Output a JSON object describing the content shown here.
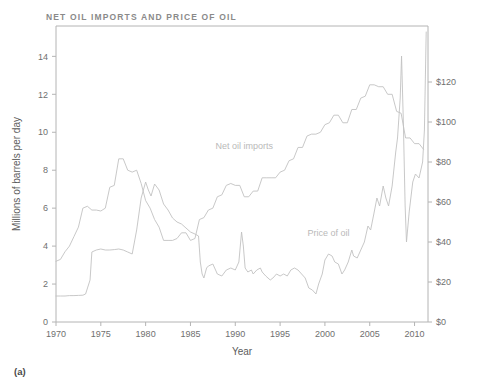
{
  "figure": {
    "title": "NET OIL IMPORTS AND PRICE OF OIL",
    "panel_label": "(a)"
  },
  "chart_data": {
    "type": "line",
    "title": "NET OIL IMPORTS AND PRICE OF OIL",
    "xlabel": "Year",
    "ylabel": "Millions of barrels per day",
    "y2label": "",
    "grid": false,
    "legend": "inline-annotations",
    "xlim": [
      1970,
      2011.5
    ],
    "ylim": [
      0,
      15.6
    ],
    "y2lim": [
      0,
      148
    ],
    "xticks": [
      1970,
      1975,
      1980,
      1985,
      1990,
      1995,
      2000,
      2005,
      2010
    ],
    "xticklabels": [
      "1970",
      "1975",
      "1980",
      "1985",
      "1990",
      "1995",
      "2000",
      "2005",
      "2010"
    ],
    "yticks": [
      0,
      2,
      4,
      6,
      8,
      10,
      12,
      14
    ],
    "yticklabels": [
      "0",
      "2",
      "4",
      "6",
      "8",
      "10",
      "12",
      "14"
    ],
    "y2ticks": [
      0,
      20,
      40,
      60,
      80,
      100,
      120
    ],
    "y2ticklabels": [
      "$0",
      "$20",
      "$40",
      "$60",
      "$80",
      "$100",
      "$120"
    ],
    "line_color": "#c2c2c2",
    "annotations": [
      {
        "text": "Net oil imports",
        "x": 1991.0,
        "y_axis": "left",
        "y": 9.1
      },
      {
        "text": "Price of oil",
        "x": 2000.4,
        "y_axis": "left",
        "y": 4.55
      }
    ],
    "series": [
      {
        "name": "Net oil imports",
        "axis": "left",
        "units": "millions of barrels per day",
        "x": [
          1970.0,
          1970.5,
          1971.0,
          1971.5,
          1972.0,
          1972.5,
          1973.0,
          1973.5,
          1974.0,
          1974.5,
          1975.0,
          1975.5,
          1976.0,
          1976.5,
          1977.0,
          1977.5,
          1978.0,
          1978.5,
          1979.0,
          1979.5,
          1980.0,
          1980.5,
          1981.0,
          1981.5,
          1982.0,
          1982.5,
          1983.0,
          1983.5,
          1984.0,
          1984.5,
          1985.0,
          1985.5,
          1986.0,
          1986.5,
          1987.0,
          1987.5,
          1988.0,
          1988.5,
          1989.0,
          1989.5,
          1990.0,
          1990.5,
          1991.0,
          1991.5,
          1992.0,
          1992.5,
          1993.0,
          1993.5,
          1994.0,
          1994.5,
          1995.0,
          1995.5,
          1996.0,
          1996.5,
          1997.0,
          1997.5,
          1998.0,
          1998.5,
          1999.0,
          1999.5,
          2000.0,
          2000.5,
          2001.0,
          2001.5,
          2002.0,
          2002.5,
          2003.0,
          2003.5,
          2004.0,
          2004.5,
          2005.0,
          2005.5,
          2006.0,
          2006.5,
          2007.0,
          2007.5,
          2008.0,
          2008.5,
          2009.0,
          2009.5,
          2010.0,
          2010.5,
          2011.0
        ],
        "y": [
          3.2,
          3.3,
          3.7,
          4.0,
          4.5,
          5.0,
          6.0,
          6.1,
          5.9,
          5.9,
          5.85,
          6.0,
          7.1,
          7.2,
          8.6,
          8.6,
          8.0,
          7.9,
          8.0,
          7.3,
          6.4,
          6.0,
          5.4,
          5.0,
          4.3,
          4.3,
          4.3,
          4.4,
          4.7,
          4.7,
          4.3,
          4.4,
          5.4,
          5.5,
          5.9,
          6.0,
          6.6,
          6.7,
          7.2,
          7.3,
          7.2,
          7.2,
          6.6,
          6.6,
          6.9,
          6.9,
          7.6,
          7.6,
          7.6,
          7.6,
          7.9,
          8.0,
          8.5,
          8.6,
          9.2,
          9.2,
          9.8,
          9.9,
          9.9,
          10.0,
          10.4,
          10.5,
          10.9,
          10.9,
          10.5,
          10.5,
          11.2,
          11.2,
          11.8,
          11.9,
          12.5,
          12.5,
          12.4,
          12.4,
          12.0,
          12.0,
          11.1,
          11.0,
          9.7,
          9.7,
          9.4,
          9.4,
          9.1
        ]
      },
      {
        "name": "Price of oil",
        "axis": "right",
        "units": "US dollars per barrel",
        "x": [
          1970.0,
          1970.5,
          1971.0,
          1971.5,
          1972.0,
          1972.5,
          1973.0,
          1973.3,
          1973.8,
          1974.0,
          1974.5,
          1975.0,
          1975.5,
          1976.0,
          1976.5,
          1977.0,
          1977.5,
          1978.0,
          1978.5,
          1979.0,
          1979.5,
          1980.0,
          1980.3,
          1980.6,
          1981.0,
          1981.5,
          1982.0,
          1982.5,
          1983.0,
          1983.5,
          1984.0,
          1984.5,
          1985.0,
          1985.5,
          1985.9,
          1986.1,
          1986.3,
          1986.5,
          1986.8,
          1987.0,
          1987.5,
          1988.0,
          1988.5,
          1989.0,
          1989.5,
          1990.0,
          1990.4,
          1990.7,
          1990.9,
          1991.1,
          1991.4,
          1991.8,
          1992.0,
          1992.4,
          1992.8,
          1993.0,
          1993.4,
          1993.9,
          1994.2,
          1994.6,
          1995.0,
          1995.4,
          1995.8,
          1996.2,
          1996.6,
          1997.0,
          1997.4,
          1997.8,
          1998.2,
          1998.6,
          1999.0,
          1999.3,
          1999.7,
          2000.0,
          2000.4,
          2000.8,
          2001.1,
          2001.5,
          2001.9,
          2002.2,
          2002.6,
          2003.0,
          2003.2,
          2003.6,
          2004.0,
          2004.4,
          2004.8,
          2005.1,
          2005.5,
          2005.8,
          2006.1,
          2006.5,
          2006.8,
          2007.1,
          2007.5,
          2007.9,
          2008.1,
          2008.4,
          2008.55,
          2008.75,
          2008.95,
          2009.1,
          2009.4,
          2009.8,
          2010.1,
          2010.5,
          2010.9,
          2011.1,
          2011.3
        ],
        "y": [
          13.0,
          13.0,
          13.0,
          13.2,
          13.2,
          13.3,
          13.4,
          14.0,
          21.0,
          35.0,
          36.0,
          36.5,
          36.0,
          36.0,
          36.2,
          36.5,
          36.0,
          35.0,
          34.0,
          46.0,
          62.0,
          70.0,
          66.0,
          63.0,
          69.0,
          66.0,
          59.0,
          56.0,
          52.0,
          50.0,
          49.0,
          47.0,
          45.0,
          44.0,
          43.0,
          30.0,
          24.0,
          22.0,
          27.0,
          28.0,
          29.0,
          24.0,
          23.0,
          26.0,
          27.0,
          26.0,
          30.0,
          45.0,
          38.0,
          27.0,
          25.0,
          26.0,
          24.0,
          26.0,
          27.0,
          25.0,
          23.0,
          21.0,
          22.0,
          24.0,
          23.0,
          24.0,
          23.0,
          26.0,
          27.0,
          26.0,
          24.0,
          22.0,
          17.0,
          16.0,
          14.0,
          19.0,
          24.0,
          31.0,
          34.0,
          33.0,
          30.0,
          29.0,
          24.0,
          26.0,
          30.0,
          36.0,
          33.0,
          32.0,
          36.0,
          40.0,
          48.0,
          46.0,
          55.0,
          62.0,
          58.0,
          68.0,
          62.0,
          58.0,
          68.0,
          85.0,
          92.0,
          112.0,
          133.0,
          100.0,
          58.0,
          40.0,
          55.0,
          70.0,
          74.0,
          72.0,
          80.0,
          96.0,
          145.0
        ]
      }
    ]
  }
}
